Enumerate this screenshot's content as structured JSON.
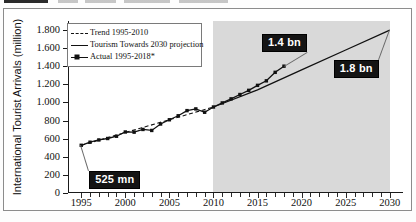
{
  "page": {
    "top_strip_visible": true
  },
  "chart_data": {
    "type": "line",
    "title": "",
    "xlabel": "",
    "ylabel": "International Tourist Arrivals (million)",
    "xlim": [
      1993.5,
      2031.5
    ],
    "ylim": [
      0,
      1900
    ],
    "yticks": [
      0,
      200,
      400,
      600,
      800,
      1000,
      1200,
      1400,
      1600,
      1800
    ],
    "ytick_labels": [
      "0",
      "200",
      "400",
      "600",
      "800",
      "1.000",
      "1.200",
      "1.400",
      "1.600",
      "1.800"
    ],
    "xticks": [
      1995,
      2000,
      2005,
      2010,
      2015,
      2020,
      2025,
      2030
    ],
    "xtick_labels": [
      "1995",
      "2000",
      "2005",
      "2010",
      "2015",
      "2020",
      "2025",
      "2030"
    ],
    "minor_xtick_step": 1,
    "grid": false,
    "legend_position": "top-left",
    "shaded_region": {
      "label": "forecast",
      "from": 2010,
      "to": 2030,
      "color": "#d9d9d9"
    },
    "series": [
      {
        "name": "Trend 1995-2010",
        "style": "dashed",
        "color": "#111111",
        "x": [
          1995,
          2010
        ],
        "values": [
          527,
          950
        ]
      },
      {
        "name": "Tourism Towards 2030 projection",
        "style": "solid",
        "color": "#111111",
        "x": [
          2010,
          2015,
          2020,
          2025,
          2030
        ],
        "values": [
          950,
          1140,
          1360,
          1580,
          1800
        ]
      },
      {
        "name": "Actual 1995-2018*",
        "style": "solid-markers",
        "color": "#111111",
        "x": [
          1995,
          1996,
          1997,
          1998,
          1999,
          2000,
          2001,
          2002,
          2003,
          2004,
          2005,
          2006,
          2007,
          2008,
          2009,
          2010,
          2011,
          2012,
          2013,
          2014,
          2015,
          2016,
          2017,
          2018
        ],
        "values": [
          527,
          561,
          586,
          602,
          627,
          674,
          672,
          702,
          691,
          762,
          809,
          853,
          910,
          929,
          892,
          950,
          995,
          1040,
          1088,
          1134,
          1189,
          1239,
          1333,
          1401
        ]
      }
    ],
    "annotations": [
      {
        "label": "525 mn",
        "at_x": 1995,
        "at_y": 527
      },
      {
        "label": "1.4 bn",
        "at_x": 2018,
        "at_y": 1401
      },
      {
        "label": "1.8 bn",
        "at_x": 2030,
        "at_y": 1800
      }
    ]
  },
  "legend": {
    "items": [
      {
        "label": "Trend 1995-2010"
      },
      {
        "label": "Tourism Towards 2030 projection"
      },
      {
        "label": "Actual 1995-2018*"
      }
    ]
  }
}
